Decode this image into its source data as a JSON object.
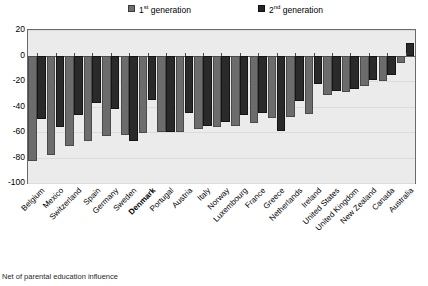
{
  "chart_data": {
    "type": "bar",
    "title": "",
    "subtitle": "",
    "xlabel": "",
    "ylabel": "",
    "ylim": [
      -100,
      20
    ],
    "yticks": [
      20,
      0,
      -20,
      -40,
      -60,
      -80,
      -100
    ],
    "ytick_labels": [
      "20",
      "0",
      "-20",
      "-40",
      "-60",
      "-80",
      "-100"
    ],
    "grid": true,
    "legend_position": "top",
    "categories": [
      "Belgium",
      "Mexico",
      "Switzerland",
      "Spain",
      "Germany",
      "Sweden",
      "Denmark",
      "Portugal",
      "Austria",
      "Italy",
      "Norway",
      "Luxembourg",
      "France",
      "Greece",
      "Netherlands",
      "Ireland",
      "United States",
      "United Kingdom",
      "New Zealand",
      "Canada",
      "Australia"
    ],
    "highlight_category": "Denmark",
    "series": [
      {
        "name": "1st generation",
        "color": "#6c6c6c",
        "values": [
          -83,
          -78,
          -71,
          -67,
          -63,
          -62,
          -61,
          -60,
          -60,
          -58,
          -56,
          -55,
          -53,
          -49,
          -48,
          -46,
          -31,
          -29,
          -24,
          -20,
          -6
        ]
      },
      {
        "name": "2nd generation",
        "color": "#2a2a2a",
        "values": [
          -50,
          -56,
          -47,
          -37,
          -42,
          -67,
          -35,
          -60,
          -45,
          -55,
          -52,
          -47,
          -45,
          -59,
          -36,
          -22,
          -28,
          -26,
          -19,
          -15,
          10
        ]
      }
    ],
    "legend": [
      {
        "label_prefix": "1",
        "label_sup": "st",
        "label_suffix": " generation",
        "color": "#6c6c6c"
      },
      {
        "label_prefix": "2",
        "label_sup": "nd",
        "label_suffix": " generation",
        "color": "#2a2a2a"
      }
    ]
  },
  "caption": "Net of parental education influence"
}
